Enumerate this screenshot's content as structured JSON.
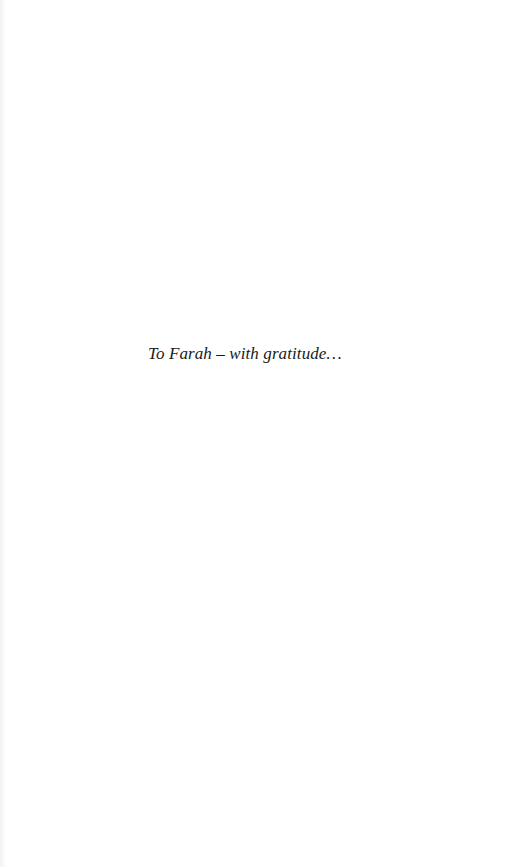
{
  "page": {
    "dedication": "To Farah – with gratitude…"
  }
}
